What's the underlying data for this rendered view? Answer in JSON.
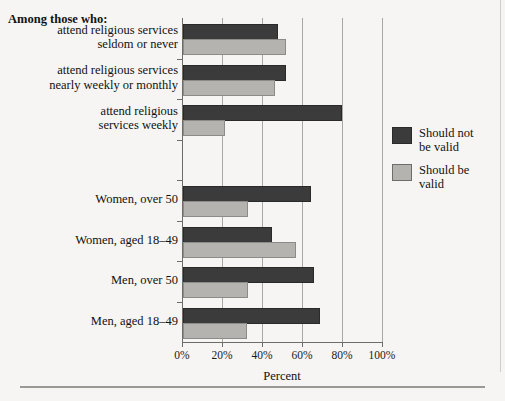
{
  "figure": {
    "intro_label": "Among those who:",
    "legend": {
      "series": [
        {
          "name": "Should not be valid",
          "label": "Should not\nbe valid",
          "color": "#3b3b3b"
        },
        {
          "name": "Should be valid",
          "label": "Should be\nvalid",
          "color": "#b4b3b0"
        }
      ]
    }
  },
  "chart_data": {
    "type": "bar",
    "orientation": "horizontal",
    "title": "",
    "xlabel": "Percent",
    "ylabel": "",
    "xlim": [
      0,
      100
    ],
    "xticks": [
      0,
      20,
      40,
      60,
      80,
      100
    ],
    "xticklabels": [
      "0%",
      "20%",
      "40%",
      "60%",
      "80%",
      "100%"
    ],
    "grid": true,
    "grid_axis": "x",
    "legend_position": "right",
    "categories": [
      "attend religious services\nseldom or never",
      "attend religious services\nnearly weekly or monthly",
      "attend religious\nservices weekly",
      "",
      "Women, over 50",
      "Women, aged 18–49",
      "Men, over 50",
      "Men, aged 18–49"
    ],
    "category_lines": [
      [
        "attend religious services",
        "seldom or never"
      ],
      [
        "attend religious services",
        "nearly weekly or monthly"
      ],
      [
        "attend religious",
        "services weekly"
      ],
      [
        ""
      ],
      [
        "Women, over 50"
      ],
      [
        "Women, aged 18–49"
      ],
      [
        "Men, over 50"
      ],
      [
        "Men, aged 18–49"
      ]
    ],
    "series": [
      {
        "name": "Should not be valid",
        "color": "#3b3b3b",
        "values": [
          46.5,
          50.5,
          78.5,
          null,
          63,
          43.5,
          64.5,
          67.5
        ]
      },
      {
        "name": "Should be valid",
        "color": "#b4b3b0",
        "values": [
          50.5,
          45,
          20,
          null,
          31.5,
          55.5,
          31.5,
          31
        ]
      }
    ]
  }
}
